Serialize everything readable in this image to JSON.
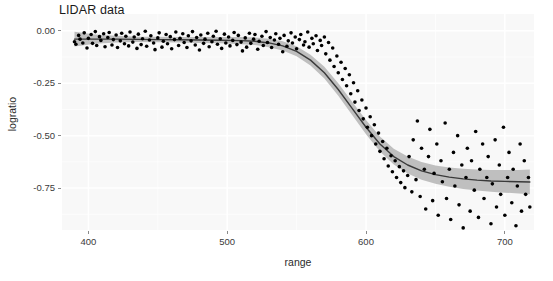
{
  "chart_data": {
    "type": "scatter",
    "title": "LIDAR data",
    "xlabel": "range",
    "ylabel": "logratio",
    "xlim": [
      381,
      721
    ],
    "ylim": [
      -0.95,
      0.08
    ],
    "xticks": [
      400,
      500,
      600,
      700
    ],
    "xtick_labels": [
      "400",
      "500",
      "600",
      "700"
    ],
    "yticks": [
      0.0,
      -0.25,
      -0.5,
      -0.75
    ],
    "ytick_labels": [
      "0.00",
      "-0.25",
      "-0.50",
      "-0.75"
    ],
    "grid": true,
    "legend": "none",
    "panel_background": "#f8f8f8",
    "gridline_color": "#ffffff",
    "point_color": "#000000",
    "point_size": 3.6,
    "smooth_line_color": "#3a3a3a",
    "smooth_band_color": "#bfbfbf",
    "series": [
      {
        "name": "observations",
        "x": [
          390.0,
          391.0,
          393.0,
          394.0,
          396.0,
          397.0,
          399.0,
          400.0,
          402.0,
          403.0,
          405.0,
          406.0,
          408.0,
          409.0,
          411.0,
          412.0,
          414.0,
          415.0,
          417.0,
          418.0,
          420.0,
          421.0,
          423.0,
          424.0,
          426.0,
          427.0,
          429.0,
          430.0,
          432.0,
          433.0,
          435.0,
          436.0,
          438.0,
          439.0,
          441.0,
          442.0,
          444.0,
          445.0,
          447.0,
          448.0,
          450.0,
          451.0,
          453.0,
          454.0,
          456.0,
          457.0,
          459.0,
          460.0,
          462.0,
          463.0,
          465.0,
          466.0,
          468.0,
          469.0,
          471.0,
          472.0,
          474.0,
          475.0,
          477.0,
          478.0,
          480.0,
          481.0,
          483.0,
          484.0,
          486.0,
          487.0,
          489.0,
          490.0,
          492.0,
          493.0,
          495.0,
          496.0,
          498.0,
          499.0,
          501.0,
          502.0,
          504.0,
          505.0,
          507.0,
          508.0,
          510.0,
          511.0,
          513.0,
          514.0,
          516.0,
          517.0,
          519.0,
          520.0,
          522.0,
          523.0,
          525.0,
          526.0,
          528.0,
          529.0,
          531.0,
          532.0,
          534.0,
          535.0,
          537.0,
          538.0,
          540.0,
          541.0,
          543.0,
          544.0,
          546.0,
          547.0,
          549.0,
          550.0,
          552.0,
          553.0,
          555.0,
          556.0,
          558.0,
          559.0,
          561.0,
          562.0,
          564.0,
          565.0,
          567.0,
          568.0,
          570.0,
          571.0,
          573.0,
          574.0,
          576.0,
          577.0,
          579.0,
          580.0,
          582.0,
          583.0,
          585.0,
          586.0,
          588.0,
          589.0,
          591.0,
          592.0,
          594.0,
          595.0,
          597.0,
          598.0,
          600.0,
          601.0,
          603.0,
          604.0,
          606.0,
          607.0,
          609.0,
          610.0,
          612.0,
          613.0,
          615.0,
          616.0,
          618.0,
          619.0,
          621.0,
          622.0,
          624.0,
          625.0,
          627.0,
          628.0,
          630.0,
          631.0,
          633.0,
          634.0,
          636.0,
          637.0,
          639.0,
          640.0,
          642.0,
          643.0,
          645.0,
          646.0,
          648.0,
          649.0,
          651.0,
          652.0,
          654.0,
          655.0,
          657.0,
          658.0,
          660.0,
          661.0,
          663.0,
          664.0,
          666.0,
          667.0,
          669.0,
          670.0,
          672.0,
          673.0,
          675.0,
          676.0,
          678.0,
          679.0,
          681.0,
          682.0,
          684.0,
          685.0,
          687.0,
          688.0,
          690.0,
          691.0,
          693.0,
          694.0,
          696.0,
          697.0,
          699.0,
          700.0,
          702.0,
          703.0,
          705.0,
          706.0,
          708.0,
          709.0,
          711.0,
          712.0,
          714.0,
          715.0,
          717.0,
          718.0
        ],
        "y": [
          -0.052,
          -0.064,
          -0.022,
          -0.04,
          -0.058,
          -0.01,
          -0.082,
          -0.036,
          -0.018,
          -0.06,
          -0.004,
          -0.07,
          -0.028,
          -0.046,
          -0.014,
          -0.076,
          -0.032,
          -0.008,
          -0.068,
          -0.042,
          -0.02,
          -0.08,
          -0.048,
          -0.012,
          -0.062,
          -0.026,
          -0.072,
          -0.006,
          -0.054,
          -0.03,
          -0.084,
          -0.016,
          -0.066,
          -0.038,
          -0.002,
          -0.074,
          -0.044,
          -0.024,
          -0.058,
          -0.09,
          -0.034,
          -0.01,
          -0.078,
          -0.05,
          -0.018,
          -0.062,
          -0.028,
          -0.086,
          -0.042,
          -0.006,
          -0.07,
          -0.036,
          -0.014,
          -0.056,
          -0.08,
          -0.024,
          -0.048,
          -0.004,
          -0.068,
          -0.032,
          -0.092,
          -0.02,
          -0.06,
          -0.04,
          -0.012,
          -0.076,
          -0.052,
          -0.026,
          -0.002,
          -0.064,
          -0.038,
          -0.084,
          -0.016,
          -0.058,
          -0.03,
          -0.072,
          -0.046,
          -0.008,
          -0.066,
          -0.022,
          -0.054,
          -0.096,
          -0.034,
          -0.078,
          -0.012,
          -0.06,
          -0.04,
          -0.018,
          -0.088,
          -0.05,
          -0.026,
          -0.07,
          -0.004,
          -0.056,
          -0.032,
          -0.08,
          -0.044,
          -0.014,
          -0.064,
          -0.036,
          -0.1,
          -0.022,
          -0.074,
          -0.048,
          -0.01,
          -0.058,
          -0.03,
          -0.086,
          -0.042,
          -0.018,
          -0.068,
          -0.052,
          -0.006,
          -0.078,
          -0.036,
          -0.062,
          -0.024,
          -0.094,
          -0.046,
          -0.07,
          -0.03,
          -0.11,
          -0.056,
          -0.14,
          -0.082,
          -0.17,
          -0.12,
          -0.2,
          -0.15,
          -0.232,
          -0.18,
          -0.262,
          -0.21,
          -0.3,
          -0.248,
          -0.34,
          -0.286,
          -0.38,
          -0.33,
          -0.42,
          -0.368,
          -0.46,
          -0.41,
          -0.5,
          -0.448,
          -0.54,
          -0.488,
          -0.575,
          -0.528,
          -0.61,
          -0.56,
          -0.645,
          -0.596,
          -0.672,
          -0.62,
          -0.7,
          -0.648,
          -0.724,
          -0.668,
          -0.748,
          -0.69,
          -0.6,
          -0.768,
          -0.52,
          -0.71,
          -0.43,
          -0.79,
          -0.56,
          -0.66,
          -0.85,
          -0.6,
          -0.47,
          -0.81,
          -0.68,
          -0.54,
          -0.88,
          -0.62,
          -0.72,
          -0.44,
          -0.8,
          -0.66,
          -0.9,
          -0.58,
          -0.74,
          -0.5,
          -0.83,
          -0.64,
          -0.94,
          -0.7,
          -0.56,
          -0.86,
          -0.62,
          -0.76,
          -0.48,
          -0.89,
          -0.66,
          -0.54,
          -0.8,
          -0.7,
          -0.6,
          -0.92,
          -0.73,
          -0.52,
          -0.84,
          -0.64,
          -0.78,
          -0.46,
          -0.88,
          -0.7,
          -0.58,
          -0.82,
          -0.66,
          -0.93,
          -0.74,
          -0.54,
          -0.86,
          -0.62,
          -0.78,
          -0.7,
          -0.84
        ]
      }
    ],
    "smooth": {
      "name": "loess-fit",
      "x": [
        390,
        405,
        420,
        435,
        450,
        465,
        480,
        495,
        510,
        520,
        530,
        540,
        550,
        560,
        570,
        580,
        590,
        600,
        610,
        620,
        630,
        640,
        650,
        660,
        670,
        680,
        690,
        700,
        710,
        718
      ],
      "y": [
        -0.04,
        -0.04,
        -0.04,
        -0.041,
        -0.042,
        -0.043,
        -0.044,
        -0.045,
        -0.047,
        -0.05,
        -0.058,
        -0.072,
        -0.098,
        -0.14,
        -0.2,
        -0.28,
        -0.37,
        -0.46,
        -0.54,
        -0.6,
        -0.64,
        -0.668,
        -0.686,
        -0.698,
        -0.706,
        -0.712,
        -0.716,
        -0.718,
        -0.72,
        -0.721
      ],
      "ymin": [
        -0.075,
        -0.062,
        -0.056,
        -0.054,
        -0.055,
        -0.056,
        -0.058,
        -0.06,
        -0.064,
        -0.068,
        -0.078,
        -0.094,
        -0.122,
        -0.166,
        -0.228,
        -0.31,
        -0.402,
        -0.494,
        -0.576,
        -0.638,
        -0.68,
        -0.71,
        -0.73,
        -0.744,
        -0.754,
        -0.762,
        -0.768,
        -0.772,
        -0.776,
        -0.78
      ],
      "ymax": [
        -0.005,
        -0.018,
        -0.024,
        -0.028,
        -0.029,
        -0.03,
        -0.03,
        -0.03,
        -0.03,
        -0.032,
        -0.038,
        -0.05,
        -0.074,
        -0.114,
        -0.172,
        -0.25,
        -0.338,
        -0.426,
        -0.504,
        -0.562,
        -0.6,
        -0.626,
        -0.642,
        -0.652,
        -0.658,
        -0.662,
        -0.664,
        -0.664,
        -0.664,
        -0.662
      ]
    }
  }
}
